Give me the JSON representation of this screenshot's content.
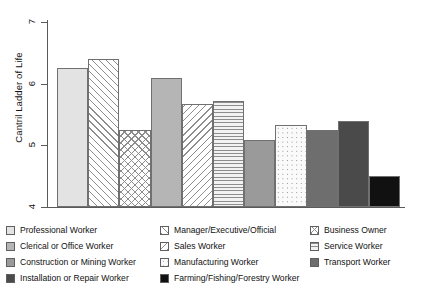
{
  "chart_data": {
    "type": "bar",
    "title": "",
    "subtitle": "",
    "xlabel": "",
    "ylabel": "Cantril Ladder of Life",
    "ylim": [
      4,
      7
    ],
    "yticks": [
      4,
      5,
      6,
      7
    ],
    "ytick_labels": [
      "4",
      "5",
      "6",
      "7"
    ],
    "grid": false,
    "legend_position": "bottom",
    "legend_columns": 3,
    "categories": [
      "Professional Worker",
      "Manager/Executive/Official",
      "Business Owner",
      "Clerical or Office Worker",
      "Sales Worker",
      "Service Worker",
      "Construction or Mining Worker",
      "Manufacturing Worker",
      "Transport Worker",
      "Installation or Repair Worker",
      "Farming/Fishing/Forestry Worker"
    ],
    "values": [
      6.25,
      6.4,
      5.25,
      6.1,
      5.67,
      5.72,
      5.08,
      5.33,
      5.25,
      5.4,
      4.5
    ],
    "bar_fills": [
      "solid-light",
      "diagonal-up-hatch",
      "cross-hatch",
      "solid-medium-light",
      "diagonal-down-hatch",
      "horizontal-lines",
      "solid-medium-dark",
      "dotted",
      "solid-dark",
      "solid-darker",
      "solid-black"
    ],
    "colors": {
      "solid-light": "#e3e3e3",
      "solid-medium-light": "#b5b5b5",
      "solid-medium-dark": "#9a9a9a",
      "solid-dark": "#6e6e6e",
      "solid-darker": "#4a4a4a",
      "solid-black": "#111111",
      "hatch-stroke": "#8d8d8d",
      "axis": "#5a5a5a",
      "bar-outline": "#707070",
      "text": "#111111"
    }
  },
  "axis": {
    "y_label": "Cantril Ladder of Life",
    "ticks": [
      {
        "label": "7",
        "value": 7
      },
      {
        "label": "6",
        "value": 6
      },
      {
        "label": "5",
        "value": 5
      },
      {
        "label": "4",
        "value": 4
      }
    ]
  },
  "legend": {
    "columns": [
      {
        "items": [
          {
            "label": "Professional Worker",
            "fill": "solid-light"
          },
          {
            "label": "Clerical or Office Worker",
            "fill": "solid-medium-light"
          },
          {
            "label": "Construction or Mining Worker",
            "fill": "solid-medium-dark"
          },
          {
            "label": "Installation or Repair Worker",
            "fill": "solid-darker"
          }
        ]
      },
      {
        "items": [
          {
            "label": "Manager/Executive/Official",
            "fill": "diagonal-up-hatch"
          },
          {
            "label": "Sales Worker",
            "fill": "diagonal-down-hatch"
          },
          {
            "label": "Manufacturing Worker",
            "fill": "dotted"
          },
          {
            "label": "Farming/Fishing/Forestry Worker",
            "fill": "solid-black"
          }
        ]
      },
      {
        "items": [
          {
            "label": "Business Owner",
            "fill": "cross-hatch"
          },
          {
            "label": "Service Worker",
            "fill": "horizontal-lines"
          },
          {
            "label": "Transport Worker",
            "fill": "solid-dark"
          }
        ]
      }
    ]
  }
}
